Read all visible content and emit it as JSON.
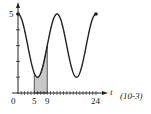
{
  "figure": {
    "label": "(10-3)",
    "x_axis_label": "t",
    "y_tick_label": "5",
    "x_tick_labels": [
      "0",
      "5",
      "9",
      "24"
    ]
  },
  "chart_data": {
    "type": "line",
    "title": "",
    "xlabel": "t",
    "ylabel": "",
    "function": "y = 3 + 2cos(pi t / 6)",
    "xlim": [
      0,
      24
    ],
    "ylim": [
      0,
      5
    ],
    "x": [
      0,
      3,
      6,
      9,
      12,
      15,
      18,
      21,
      24
    ],
    "values": [
      5,
      3,
      1,
      3,
      5,
      3,
      1,
      3,
      5
    ],
    "shaded_region": {
      "from": 5,
      "to": 9
    },
    "endpoints": [
      {
        "x": 0,
        "y": 5
      },
      {
        "x": 24,
        "y": 5
      }
    ],
    "y_ticks": [
      1,
      2,
      3,
      4,
      5
    ],
    "x_minor_ticks_step": 1,
    "annotation": "(10-3)"
  }
}
